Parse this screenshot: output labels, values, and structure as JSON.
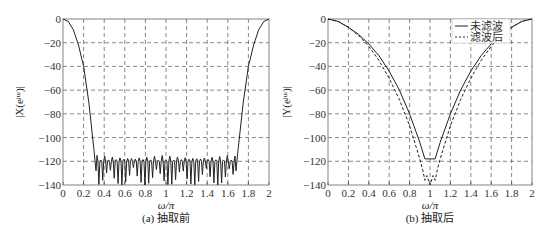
{
  "chart_data": [
    {
      "type": "line",
      "title": "",
      "caption": "(a) 抽取前",
      "xlabel": "ω/π",
      "ylabel": "|X(e^jω)|",
      "xlim": [
        0,
        2
      ],
      "ylim": [
        -140,
        0
      ],
      "grid": true,
      "x_ticks": [
        "0",
        "0.2",
        "0.4",
        "0.6",
        "0.8",
        "1",
        "1.2",
        "1.4",
        "1.6",
        "1.8",
        "2"
      ],
      "y_ticks": [
        "0",
        "-20",
        "-40",
        "-60",
        "-80",
        "-100",
        "-120",
        "-140"
      ],
      "series": [
        {
          "name": "X",
          "style": "solid",
          "x": [
            0,
            0.05,
            0.1,
            0.15,
            0.2,
            0.25,
            0.3,
            0.32,
            0.35,
            1.0,
            1.65,
            1.68,
            1.7,
            1.75,
            1.8,
            1.85,
            1.9,
            1.95,
            2.0
          ],
          "values": [
            0,
            -2,
            -9,
            -22,
            -40,
            -70,
            -110,
            -128,
            -118,
            -120,
            -118,
            -128,
            -110,
            -70,
            -40,
            -22,
            -9,
            -2,
            0
          ],
          "note": "stopband ripple between ω/π≈0.32 and 1.68, peaks near -115 to -120, dips reaching -140"
        }
      ]
    },
    {
      "type": "line",
      "title": "",
      "caption": "(b) 抽取后",
      "xlabel": "ω/π",
      "ylabel": "|Y(e^jω)|",
      "xlim": [
        0,
        2
      ],
      "ylim": [
        -140,
        0
      ],
      "grid": true,
      "legend": {
        "position": "upper-right",
        "entries": [
          "未滤波",
          "滤波后"
        ]
      },
      "x_ticks": [
        "0",
        "0.2",
        "0.4",
        "0.6",
        "0.8",
        "1",
        "1.2",
        "1.4",
        "1.6",
        "1.8",
        "2"
      ],
      "y_ticks": [
        "0",
        "-20",
        "-40",
        "-60",
        "-80",
        "-100",
        "-120",
        "-140"
      ],
      "series": [
        {
          "name": "未滤波",
          "style": "solid",
          "x": [
            0,
            0.1,
            0.2,
            0.3,
            0.4,
            0.5,
            0.6,
            0.7,
            0.8,
            0.9,
            0.95,
            1.0,
            1.05,
            1.1,
            1.2,
            1.3,
            1.4,
            1.5,
            1.6,
            1.7,
            1.8,
            1.9,
            2.0
          ],
          "values": [
            0,
            -2,
            -7,
            -13,
            -21,
            -31,
            -44,
            -60,
            -80,
            -104,
            -118,
            -118,
            -118,
            -104,
            -80,
            -60,
            -44,
            -31,
            -21,
            -13,
            -7,
            -2,
            0
          ]
        },
        {
          "name": "滤波后",
          "style": "dashed",
          "x": [
            0,
            0.1,
            0.2,
            0.3,
            0.4,
            0.5,
            0.6,
            0.7,
            0.8,
            0.9,
            0.95,
            1.0,
            1.05,
            1.1,
            1.2,
            1.3,
            1.4,
            1.5,
            1.6,
            1.7,
            1.8,
            1.9,
            2.0
          ],
          "values": [
            0,
            -2,
            -7,
            -14,
            -23,
            -35,
            -50,
            -68,
            -90,
            -118,
            -135,
            -140,
            -135,
            -118,
            -90,
            -68,
            -50,
            -35,
            -23,
            -14,
            -7,
            -2,
            0
          ]
        }
      ]
    }
  ],
  "labels": {
    "a_caption": "(a) 抽取前",
    "b_caption": "(b) 抽取后",
    "xlabel": "ω/π",
    "a_ylabel": "|X(eʲᵚ)|",
    "b_ylabel": "|Y(eʲᵚ)|",
    "legend_solid": "未滤波",
    "legend_dashed": "滤波后"
  }
}
